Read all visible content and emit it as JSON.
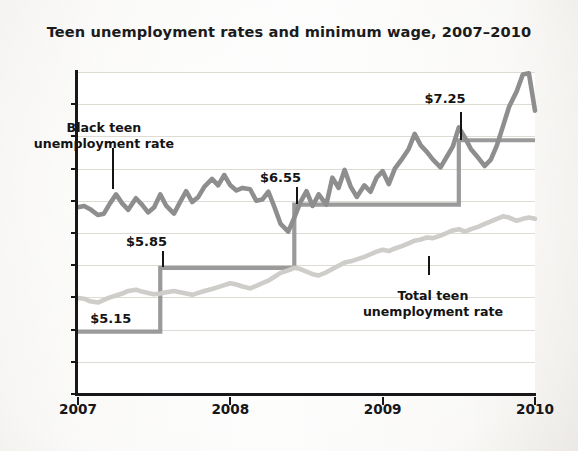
{
  "chart_data": {
    "type": "line",
    "title": "Teen unemployment rates and minimum wage, 2007–2010",
    "xlabel": "",
    "ylabel": "",
    "xlim": [
      2007,
      2010
    ],
    "ylim": [
      0,
      50
    ],
    "y_ticks": [
      "50%",
      "45",
      "40",
      "35",
      "30",
      "25",
      "20",
      "15",
      "10",
      "5",
      "0"
    ],
    "y_tick_values": [
      50,
      45,
      40,
      35,
      30,
      25,
      20,
      15,
      10,
      5,
      0
    ],
    "x_ticks": [
      "2007",
      "2008",
      "2009",
      "2010"
    ],
    "x_tick_values": [
      2007,
      2008,
      2009,
      2010
    ],
    "grid": true,
    "legend_position": "inline-annotations",
    "series": [
      {
        "name": "Black teen unemployment rate",
        "color": "#8e8e8e",
        "x": [
          2007.0,
          2007.04,
          2007.08,
          2007.13,
          2007.17,
          2007.21,
          2007.25,
          2007.29,
          2007.33,
          2007.38,
          2007.42,
          2007.46,
          2007.5,
          2007.54,
          2007.58,
          2007.63,
          2007.67,
          2007.71,
          2007.75,
          2007.79,
          2007.83,
          2007.88,
          2007.92,
          2007.96,
          2008.0,
          2008.04,
          2008.08,
          2008.13,
          2008.17,
          2008.21,
          2008.25,
          2008.29,
          2008.33,
          2008.38,
          2008.42,
          2008.46,
          2008.5,
          2008.54,
          2008.58,
          2008.63,
          2008.67,
          2008.71,
          2008.75,
          2008.79,
          2008.83,
          2008.88,
          2008.92,
          2008.96,
          2009.0,
          2009.04,
          2009.08,
          2009.13,
          2009.17,
          2009.21,
          2009.25,
          2009.29,
          2009.33,
          2009.38,
          2009.42,
          2009.46,
          2009.5,
          2009.54,
          2009.58,
          2009.63,
          2009.67,
          2009.71,
          2009.75,
          2009.79,
          2009.83,
          2009.88,
          2009.92,
          2009.96,
          2010.0
        ],
        "values": [
          29.0,
          29.2,
          28.7,
          27.8,
          28.0,
          29.6,
          31.0,
          29.6,
          28.6,
          30.4,
          29.4,
          28.2,
          29.0,
          31.0,
          29.2,
          28.0,
          29.8,
          31.5,
          29.8,
          30.6,
          32.2,
          33.4,
          32.4,
          34.0,
          32.4,
          31.6,
          32.0,
          31.8,
          30.0,
          30.2,
          31.4,
          29.0,
          26.4,
          25.2,
          27.4,
          29.8,
          31.5,
          29.2,
          31.0,
          29.4,
          33.6,
          32.0,
          34.8,
          32.2,
          30.6,
          32.4,
          31.4,
          33.6,
          34.6,
          32.6,
          35.0,
          36.6,
          38.0,
          40.4,
          38.6,
          37.6,
          36.4,
          35.2,
          36.8,
          38.4,
          41.4,
          39.8,
          38.0,
          36.6,
          35.4,
          36.4,
          38.6,
          41.6,
          44.6,
          47.0,
          49.6,
          49.8,
          44.0
        ]
      },
      {
        "name": "Total teen unemployment rate",
        "color": "#cfcdc9",
        "x": [
          2007.0,
          2007.04,
          2007.08,
          2007.13,
          2007.17,
          2007.21,
          2007.25,
          2007.29,
          2007.33,
          2007.38,
          2007.42,
          2007.46,
          2007.5,
          2007.54,
          2007.58,
          2007.63,
          2007.67,
          2007.71,
          2007.75,
          2007.79,
          2007.83,
          2007.88,
          2007.92,
          2007.96,
          2008.0,
          2008.04,
          2008.08,
          2008.13,
          2008.17,
          2008.21,
          2008.25,
          2008.29,
          2008.33,
          2008.38,
          2008.42,
          2008.46,
          2008.5,
          2008.54,
          2008.58,
          2008.63,
          2008.67,
          2008.71,
          2008.75,
          2008.79,
          2008.83,
          2008.88,
          2008.92,
          2008.96,
          2009.0,
          2009.04,
          2009.08,
          2009.13,
          2009.17,
          2009.21,
          2009.25,
          2009.29,
          2009.33,
          2009.38,
          2009.42,
          2009.46,
          2009.5,
          2009.54,
          2009.58,
          2009.63,
          2009.67,
          2009.71,
          2009.75,
          2009.79,
          2009.83,
          2009.88,
          2009.92,
          2009.96,
          2010.0
        ],
        "values": [
          14.9,
          14.8,
          14.4,
          14.2,
          14.6,
          15.0,
          15.3,
          15.6,
          16.0,
          16.2,
          15.9,
          15.7,
          15.5,
          15.6,
          15.8,
          16.0,
          15.8,
          15.6,
          15.4,
          15.7,
          16.0,
          16.3,
          16.6,
          16.9,
          17.2,
          17.0,
          16.7,
          16.4,
          16.8,
          17.2,
          17.6,
          18.2,
          18.8,
          19.2,
          19.6,
          19.4,
          19.0,
          18.6,
          18.4,
          18.9,
          19.4,
          19.9,
          20.4,
          20.6,
          20.9,
          21.3,
          21.7,
          22.1,
          22.4,
          22.2,
          22.6,
          23.0,
          23.4,
          23.8,
          24.0,
          24.3,
          24.2,
          24.6,
          25.0,
          25.4,
          25.6,
          25.2,
          25.6,
          26.0,
          26.4,
          26.8,
          27.2,
          27.6,
          27.4,
          26.9,
          27.2,
          27.4,
          27.2
        ]
      },
      {
        "name": "Federal minimum wage (step)",
        "color": "#9a9a9a",
        "type": "step",
        "steps": [
          {
            "label": "$5.15",
            "wage": 5.15,
            "level": 9.7,
            "x_start": 2007.0,
            "x_end": 2007.54
          },
          {
            "label": "$5.85",
            "wage": 5.85,
            "level": 19.6,
            "x_start": 2007.54,
            "x_end": 2008.42
          },
          {
            "label": "$6.55",
            "wage": 6.55,
            "level": 29.4,
            "x_start": 2008.42,
            "x_end": 2009.5
          },
          {
            "label": "$7.25",
            "wage": 7.25,
            "level": 39.4,
            "x_start": 2009.5,
            "x_end": 2010.0
          }
        ]
      }
    ],
    "annotations": [
      {
        "id": "black-teen",
        "line1": "Black teen",
        "line2": "unemployment rate",
        "text_x": 2007.17,
        "text_y": 42.5,
        "leader_x": 2007.22,
        "leader_y_top": 38.2,
        "leader_y_bottom": 31.8
      },
      {
        "id": "total-teen",
        "line1": "Total teen",
        "line2": "unemployment rate",
        "text_x": 2009.33,
        "text_y": 16.5,
        "leader_x": 2009.3,
        "leader_y_top": 21.5,
        "leader_y_bottom": 18.4
      }
    ],
    "wage_labels": [
      {
        "label": "$5.15",
        "text_x": 2007.08,
        "text_y": 11.6,
        "leader": false
      },
      {
        "label": "$5.85",
        "text_x": 2007.45,
        "text_y": 23.6,
        "leader_x": 2007.55,
        "leader_y_top": 22.2,
        "leader_y_bottom": 19.7
      },
      {
        "label": "$6.55",
        "text_x": 2008.33,
        "text_y": 33.6,
        "leader_x": 2008.43,
        "leader_y_top": 32.2,
        "leader_y_bottom": 29.5
      },
      {
        "label": "$7.25",
        "text_x": 2009.41,
        "text_y": 45.8,
        "leader_x": 2009.51,
        "leader_y_top": 43.8,
        "leader_y_bottom": 39.5
      }
    ]
  }
}
